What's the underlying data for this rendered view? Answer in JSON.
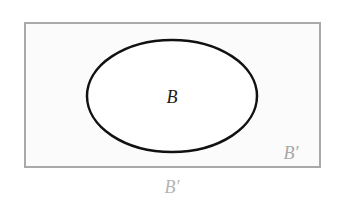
{
  "diagram": {
    "type": "venn",
    "universe": {
      "shape": "rectangle",
      "x": 25,
      "y": 23,
      "width": 295,
      "height": 144,
      "fill": "#fbfbfb",
      "stroke": "#a9a9a9",
      "stroke_width": 2
    },
    "set": {
      "name": "B",
      "shape": "ellipse",
      "cx": 172,
      "cy": 96,
      "rx": 85,
      "ry": 56,
      "fill": "#ffffff",
      "stroke": "#111111",
      "stroke_width": 2.5
    },
    "labels": {
      "set_label": "B",
      "complement_inside_label": "B′",
      "complement_outside_label": "B′"
    },
    "colors": {
      "set_label": "#1a1a1a",
      "complement_label": "#a8a8a8"
    }
  }
}
